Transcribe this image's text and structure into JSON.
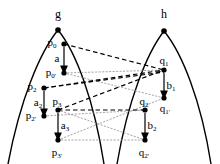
{
  "figure": {
    "title": "",
    "background_color": "#ffffff",
    "stroke_color": "#000000",
    "width": 220,
    "height": 164,
    "curves": [
      {
        "name": "arch-g",
        "apex": [
          58,
          30
        ],
        "left_base": [
          8,
          164
        ],
        "right_base": [
          104,
          164
        ]
      },
      {
        "name": "arch-h",
        "apex": [
          164,
          31
        ],
        "left_base": [
          117,
          164
        ],
        "right_base": [
          211,
          164
        ]
      }
    ],
    "apex_labels": [
      {
        "id": "g",
        "text": "g",
        "x": 58,
        "y": 14
      },
      {
        "id": "h",
        "text": "h",
        "x": 164,
        "y": 14
      }
    ],
    "points": [
      {
        "id": "apex-g",
        "x": 58,
        "y": 30,
        "label": "",
        "label_x": 0,
        "label_y": 0
      },
      {
        "id": "apex-h",
        "x": 164,
        "y": 31,
        "label": "",
        "label_x": 0,
        "label_y": 0
      },
      {
        "id": "p0",
        "x": 64,
        "y": 44,
        "label": "p0",
        "label_x": 52,
        "label_y": 42
      },
      {
        "id": "p0p",
        "x": 64,
        "y": 73,
        "label": "p0'",
        "label_x": 51,
        "label_y": 72
      },
      {
        "id": "p2",
        "x": 44,
        "y": 88,
        "label": "p2",
        "label_x": 32,
        "label_y": 86
      },
      {
        "id": "p2p",
        "x": 44,
        "y": 116,
        "label": "p2'",
        "label_x": 31,
        "label_y": 115
      },
      {
        "id": "p3",
        "x": 58,
        "y": 110,
        "label": "p3",
        "label_x": 57,
        "label_y": 101
      },
      {
        "id": "p3p",
        "x": 58,
        "y": 140,
        "label": "p3'",
        "label_x": 57,
        "label_y": 152
      },
      {
        "id": "q1",
        "x": 164,
        "y": 70,
        "label": "q1",
        "label_x": 164,
        "label_y": 60
      },
      {
        "id": "q1p",
        "x": 164,
        "y": 98,
        "label": "q1'",
        "label_x": 165,
        "label_y": 108
      },
      {
        "id": "q2",
        "x": 145,
        "y": 110,
        "label": "q2",
        "label_x": 144,
        "label_y": 101
      },
      {
        "id": "q2p",
        "x": 145,
        "y": 140,
        "label": "q2'",
        "label_x": 144,
        "label_y": 152
      }
    ],
    "arrows": [
      {
        "id": "a",
        "from": [
          64,
          47
        ],
        "to": [
          64,
          71
        ],
        "label": "a",
        "label_x": 57,
        "label_y": 58
      },
      {
        "id": "a2",
        "from": [
          44,
          91
        ],
        "to": [
          44,
          114
        ],
        "label": "a2",
        "label_x": 38,
        "label_y": 102
      },
      {
        "id": "a3",
        "from": [
          58,
          113
        ],
        "to": [
          58,
          138
        ],
        "label": "a3",
        "label_x": 65,
        "label_y": 125
      },
      {
        "id": "b1",
        "from": [
          164,
          73
        ],
        "to": [
          164,
          96
        ],
        "label": "b1",
        "label_x": 171,
        "label_y": 85
      },
      {
        "id": "b2",
        "from": [
          145,
          113
        ],
        "to": [
          145,
          138
        ],
        "label": "b2",
        "label_x": 152,
        "label_y": 125
      }
    ],
    "dashed_links": [
      {
        "id": "p0-q1",
        "from": "p0",
        "to": "q1"
      },
      {
        "id": "p2-q1",
        "from": "p2",
        "to": "q1"
      },
      {
        "id": "p3-q1",
        "from": "p3",
        "to": "q1"
      },
      {
        "id": "p3-q2",
        "from": "p3",
        "to": "q2"
      },
      {
        "id": "p2-q2",
        "from": "p2",
        "to": "q2"
      }
    ],
    "dotted_links": [
      {
        "id": "p0p-q1",
        "from": "p0p",
        "to": "q1"
      },
      {
        "id": "p0p-q1p",
        "from": "p0p",
        "to": "q1p"
      },
      {
        "id": "p2p-q2",
        "from": "p2p",
        "to": "q2"
      },
      {
        "id": "p3p-q2p",
        "from": "p3p",
        "to": "q2p"
      },
      {
        "id": "p3p-q1p",
        "from": "p3p",
        "to": "q1p"
      },
      {
        "id": "p3-q2p",
        "from": "p3",
        "to": "q2p"
      }
    ]
  }
}
